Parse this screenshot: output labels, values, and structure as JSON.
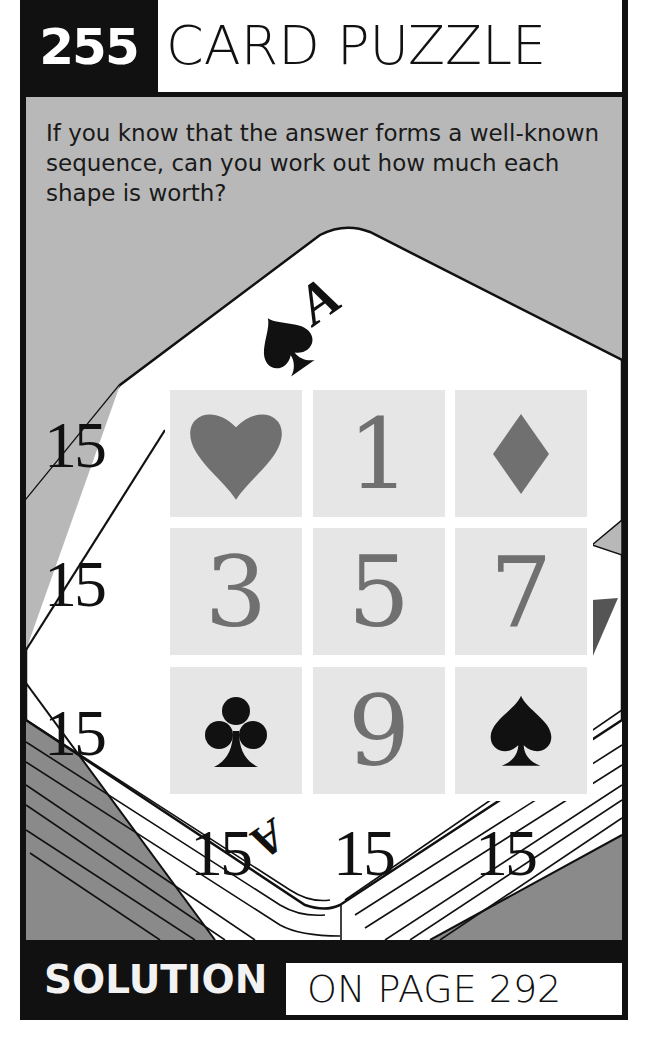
{
  "header": {
    "puzzle_number": "255",
    "title": "CARD PUZZLE"
  },
  "prompt": "If you know that the answer forms a well-known sequence, can you work out how much each shape is worth?",
  "grid": {
    "cells": [
      [
        {
          "type": "symbol",
          "icon": "heart-icon",
          "color": "#707070"
        },
        {
          "type": "number",
          "value": "1"
        },
        {
          "type": "symbol",
          "icon": "diamond-icon",
          "color": "#707070"
        }
      ],
      [
        {
          "type": "number",
          "value": "3"
        },
        {
          "type": "number",
          "value": "5"
        },
        {
          "type": "number",
          "value": "7"
        }
      ],
      [
        {
          "type": "symbol",
          "icon": "club-icon",
          "color": "#111111"
        },
        {
          "type": "number",
          "value": "9"
        },
        {
          "type": "symbol",
          "icon": "spade-icon",
          "color": "#111111"
        }
      ]
    ],
    "row_sums": [
      "15",
      "15",
      "15"
    ],
    "column_sums": [
      "15",
      "15",
      "15"
    ]
  },
  "card_art": {
    "top_card_rank": "A",
    "top_card_suit_icon": "spade-icon",
    "bottom_card_rank": "A"
  },
  "footer": {
    "label": "SOLUTION",
    "reference": "ON PAGE 292"
  },
  "colors": {
    "frame": "#111111",
    "panel_gray": "#b8b8b8",
    "dark_gray": "#8a8a8a",
    "cell_bg": "#e6e6e6",
    "red_suit_gray": "#707070"
  }
}
